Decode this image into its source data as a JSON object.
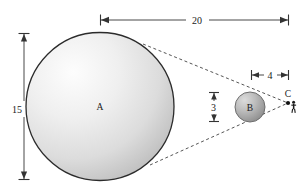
{
  "figure": {
    "background_color": "#ffffff",
    "line_color": "#333333",
    "dash_color": "#555555"
  },
  "bodies": [
    {
      "id": "A",
      "label": "A",
      "shape": "sphere",
      "cx": 100,
      "cy": 106.5,
      "r": 74,
      "diameter_value": "15",
      "fill_light": "#fbfbfb",
      "fill_dark": "#c4c4c4",
      "stroke": "#2b2b2b"
    },
    {
      "id": "B",
      "label": "B",
      "shape": "sphere",
      "cx": 250,
      "cy": 107,
      "r": 15,
      "diameter_value": "3",
      "fill_light": "#d8d8d8",
      "fill_dark": "#8f8f8f",
      "stroke": "#6e6e6e"
    }
  ],
  "points": [
    {
      "id": "C",
      "label": "C",
      "x": 288,
      "y": 103,
      "label_x": 288,
      "label_y": 96
    }
  ],
  "person": {
    "name": "observer-figure",
    "x": 293,
    "y": 104
  },
  "dimensions": [
    {
      "name": "dimension-20",
      "value": "20",
      "orientation": "horizontal",
      "x1": 100,
      "x2": 289,
      "y": 20,
      "label_x": 197,
      "label_y": 18
    },
    {
      "name": "dimension-15",
      "value": "15",
      "orientation": "vertical",
      "x": 24,
      "y1": 33,
      "y2": 180,
      "label_x": 18,
      "label_y": 109
    },
    {
      "name": "dimension-4",
      "value": "4",
      "orientation": "horizontal",
      "x1": 251,
      "x2": 289,
      "y": 75,
      "label_x": 270,
      "label_y": 73
    },
    {
      "name": "dimension-3",
      "value": "3",
      "orientation": "vertical",
      "x": 214,
      "y1": 92,
      "y2": 122,
      "label_x": 209,
      "label_y": 109
    }
  ],
  "tangent_lines": [
    {
      "name": "upper-tangent-line",
      "x1": 143,
      "y1": 44,
      "x2": 288,
      "y2": 103,
      "style": "dashed"
    },
    {
      "name": "lower-tangent-line",
      "x1": 150,
      "y1": 165,
      "x2": 288,
      "y2": 103,
      "style": "dashed"
    }
  ]
}
